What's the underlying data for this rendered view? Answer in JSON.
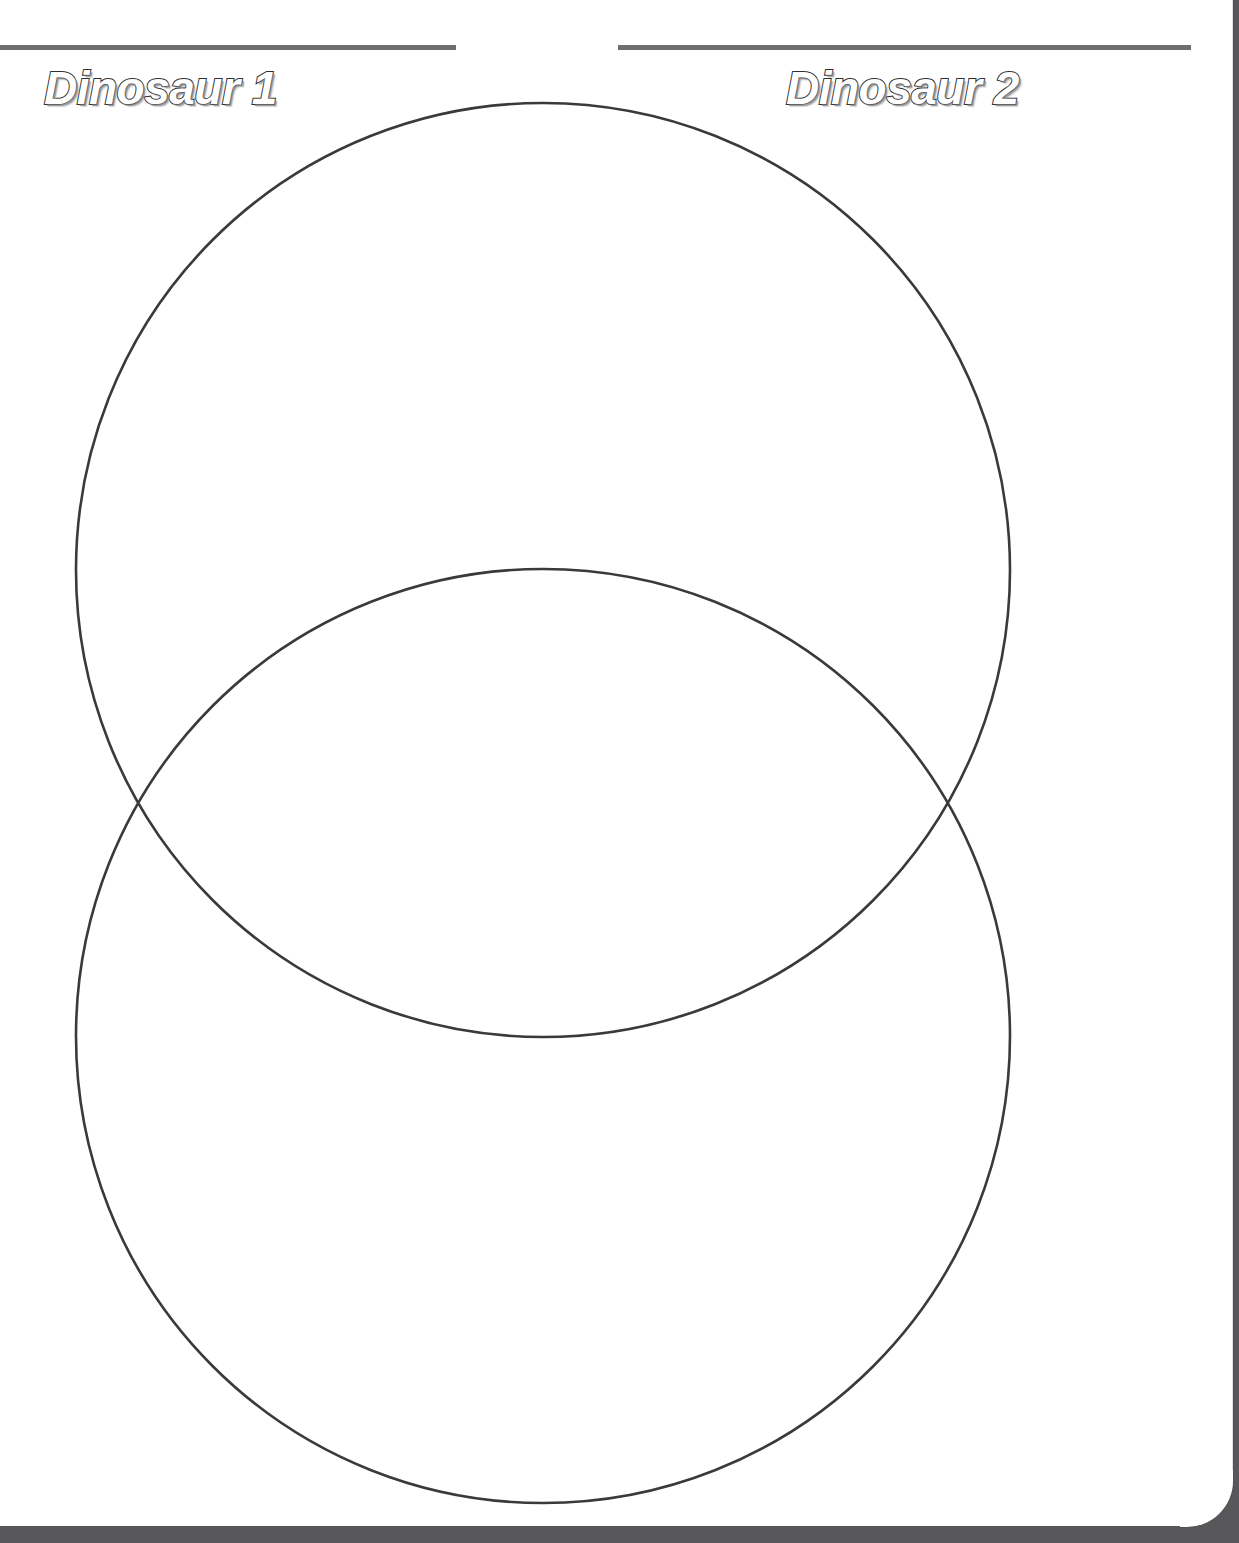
{
  "worksheet": {
    "type": "venn-diagram",
    "headers": [
      {
        "label": "Dinosaur 1",
        "side": "left"
      },
      {
        "label": "Dinosaur 2",
        "side": "right"
      }
    ],
    "rules": [
      {
        "name": "left-rule",
        "x": 0,
        "y": 45,
        "width": 456,
        "color": "#6e6e70"
      },
      {
        "name": "right-rule",
        "x": 618,
        "y": 45,
        "width": 573,
        "color": "#6e6e70"
      }
    ],
    "diagram": {
      "stroke_color": "#3a3a3c",
      "stroke_width": 2.6,
      "fill": "none",
      "circles": [
        {
          "name": "upper-circle",
          "label": "Dinosaur 1",
          "cx": 543,
          "cy": 570,
          "r": 467
        },
        {
          "name": "lower-circle",
          "label": "Dinosaur 2",
          "cx": 543,
          "cy": 1036,
          "r": 467
        }
      ],
      "intersections": [
        {
          "x": 150,
          "y": 802
        },
        {
          "x": 935,
          "y": 802
        }
      ],
      "regions": [
        {
          "name": "left-only-region",
          "label": "Dinosaur 1"
        },
        {
          "name": "overlap-region",
          "label": "Both"
        },
        {
          "name": "right-only-region",
          "label": "Dinosaur 2"
        }
      ]
    },
    "page": {
      "background": "#ffffff",
      "edge_shadow_color": "#58585a",
      "edge_line_color": "#e3e3e5",
      "corner_radius": 46
    }
  }
}
